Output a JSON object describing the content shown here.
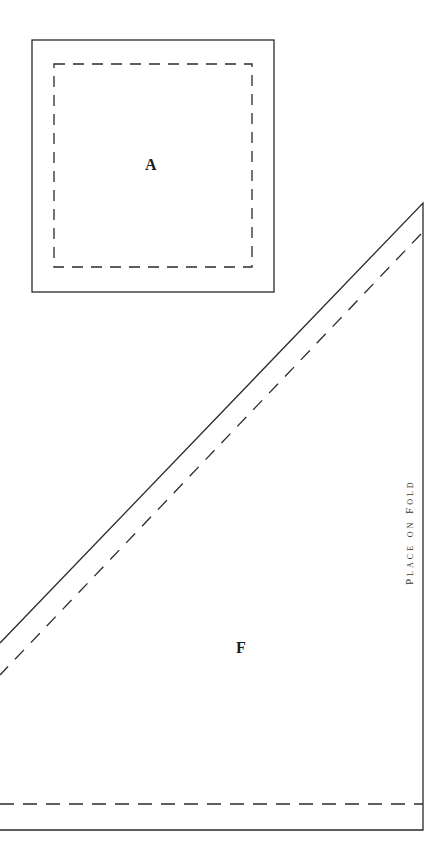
{
  "pieces": [
    {
      "id": "A",
      "label": "A",
      "shape": "square"
    },
    {
      "id": "F",
      "label": "F",
      "shape": "right-triangle"
    }
  ],
  "annotations": {
    "fold_text": "Place on Fold"
  },
  "colors": {
    "line": "#2a2a2a",
    "background": "#ffffff"
  }
}
